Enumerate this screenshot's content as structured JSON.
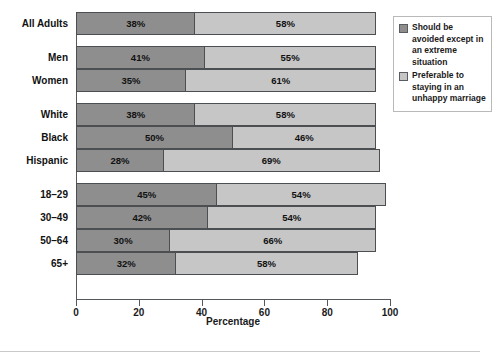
{
  "chart_data": {
    "type": "bar",
    "orientation": "horizontal",
    "stacked": true,
    "title": "",
    "xlabel": "Percentage",
    "ylabel": "",
    "xlim": [
      0,
      100
    ],
    "xticks": [
      0,
      20,
      40,
      60,
      80,
      100
    ],
    "grid": false,
    "legend_position": "right",
    "categories": [
      "All Adults",
      "Men",
      "Women",
      "White",
      "Black",
      "Hispanic",
      "18–29",
      "30–49",
      "50–64",
      "65+"
    ],
    "groups": [
      {
        "name": "overall",
        "categories": [
          "All Adults"
        ]
      },
      {
        "name": "gender",
        "categories": [
          "Men",
          "Women"
        ]
      },
      {
        "name": "race",
        "categories": [
          "White",
          "Black",
          "Hispanic"
        ]
      },
      {
        "name": "age",
        "categories": [
          "18–29",
          "30–49",
          "50–64",
          "65+"
        ]
      }
    ],
    "series": [
      {
        "name": "Should be avoided except in an extreme situation",
        "color": "#8e8e8e",
        "values": [
          38,
          41,
          35,
          38,
          50,
          28,
          45,
          42,
          30,
          32
        ],
        "labels": [
          "38%",
          "41%",
          "35%",
          "38%",
          "50%",
          "28%",
          "45%",
          "42%",
          "30%",
          "32%"
        ]
      },
      {
        "name": "Preferable to staying in an unhappy marriage",
        "color": "#c6c6c6",
        "values": [
          58,
          55,
          61,
          58,
          46,
          69,
          54,
          54,
          66,
          58
        ],
        "labels": [
          "58%",
          "55%",
          "61%",
          "58%",
          "46%",
          "69%",
          "54%",
          "54%",
          "66%",
          "58%"
        ]
      }
    ],
    "tick_labels": [
      "0",
      "20",
      "40",
      "60",
      "80",
      "100"
    ]
  },
  "legend": {
    "entries": [
      {
        "label": "Should be avoided except in an extreme situation",
        "swatch": "dark"
      },
      {
        "label": "Preferable to staying in an unhappy marriage",
        "swatch": "light"
      }
    ]
  },
  "colors": {
    "dark_segment": "#8e8e8e",
    "light_segment": "#c6c6c6",
    "axis": "#55585c",
    "text": "#1a1a1a"
  }
}
